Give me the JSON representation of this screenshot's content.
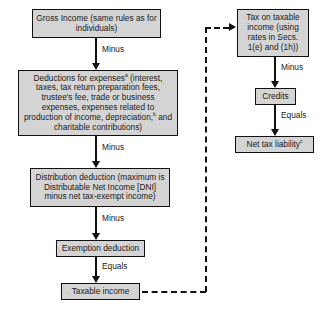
{
  "diagram": {
    "style": {
      "node_fill": "#d4d4d4",
      "node_border": "#111111",
      "text_color": "#1a1a1a",
      "connector_color": "#111111",
      "background": "#ffffff"
    },
    "nodes": {
      "gross_income": {
        "text": "Gross Income (same rules as for individuals)"
      },
      "deductions": {
        "text_before_sup_a": "Deductions for expenses",
        "sup_a": "a",
        "text_after_sup_a": " (interest, taxes, tax return preparation fees, trustee's fee, trade or business expenses, expenses related to production of income, depreciation,",
        "sup_b": "b",
        "text_after_sup_b": " and charitable contributions)"
      },
      "distribution_deduction": {
        "text": "Distribution deduction (maximum is Distributable Net Income [DNI] minus net tax-exempt income)"
      },
      "exemption_deduction": {
        "text": "Exemption deduction"
      },
      "taxable_income": {
        "text": "Taxable income"
      },
      "tax_on_taxable_income": {
        "text": "Tax on taxable income (using rates in Secs. 1(e) and (1h))"
      },
      "credits": {
        "text": "Credits"
      },
      "net_tax_liability": {
        "text_main": "Net tax liability",
        "sup_c": "c"
      }
    },
    "operators": {
      "minus_1": "Minus",
      "minus_2": "Minus",
      "minus_3": "Minus",
      "equals_1": "Equals",
      "minus_4": "Minus",
      "equals_2": "Equals"
    }
  }
}
